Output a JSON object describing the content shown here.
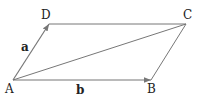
{
  "diagram": {
    "type": "parallelogram-vectors",
    "line_color": "#777777",
    "points": {
      "A": {
        "label": "A",
        "x": 13,
        "y": 80
      },
      "B": {
        "label": "B",
        "x": 151,
        "y": 80
      },
      "C": {
        "label": "C",
        "x": 186,
        "y": 24
      },
      "D": {
        "label": "D",
        "x": 49,
        "y": 24
      }
    },
    "vectors": {
      "a": {
        "label": "a",
        "from": "A",
        "to": "D"
      },
      "b": {
        "label": "b",
        "from": "A",
        "to": "B"
      }
    },
    "segments": [
      "D-C",
      "B-C",
      "A-C"
    ]
  }
}
